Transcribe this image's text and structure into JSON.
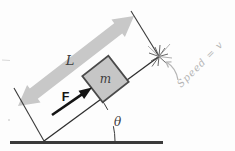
{
  "figure": {
    "kind": "block-on-inclined-plane-diagram",
    "labels": {
      "length": "L",
      "mass": "m",
      "force": "F",
      "angle": "θ"
    },
    "handwritten": {
      "note": "Speed = v"
    },
    "colors": {
      "dimension_arrow": "#c8c8c8",
      "block_fill": "#c6c6c6",
      "block_stroke": "#4a4a4a",
      "diagram_line": "#2f2f2f",
      "thin_line": "#3a3a3a",
      "ground_line": "#3b3b3b",
      "force_arrow": "#141414",
      "spark_dark": "#555555",
      "spark_light": "#9a9a9a",
      "pencil_gray": "#b5b5b5",
      "artifact_gray": "#d8d8d8",
      "label_color": "#3d3d3d"
    }
  }
}
